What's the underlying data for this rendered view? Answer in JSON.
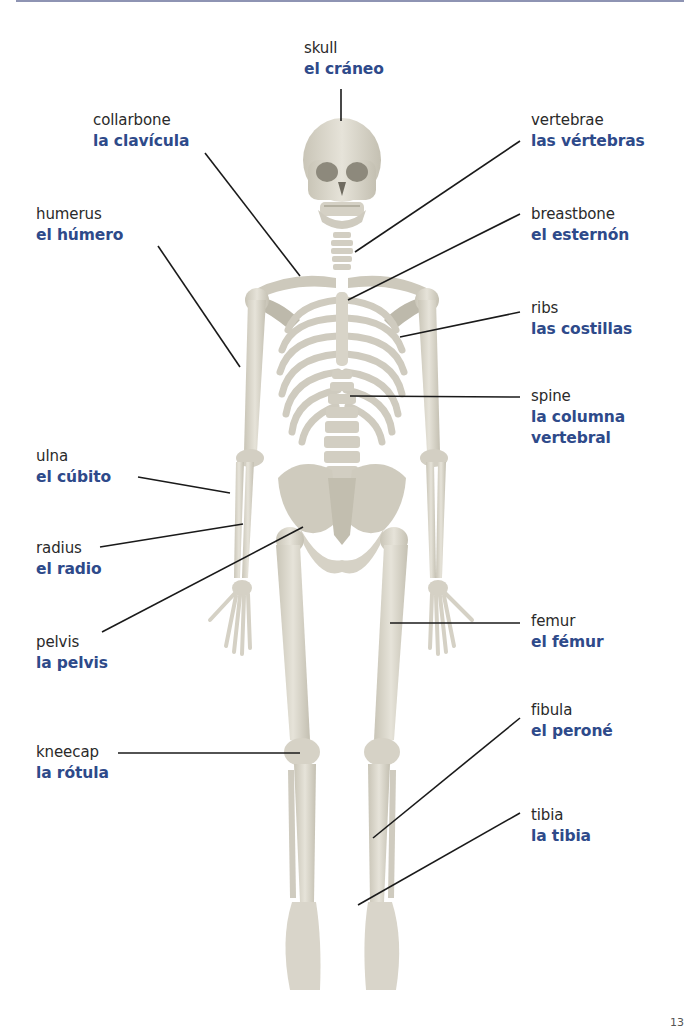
{
  "diagram": {
    "colors": {
      "english_text": "#2a2a2a",
      "spanish_text": "#2e4a8a",
      "bone": "#dedbd0",
      "bone_shade": "#b9b5a6",
      "leader_line": "#1a1a1a",
      "top_rule": "#8e94b3"
    },
    "labels": [
      {
        "id": "skull",
        "en": "skull",
        "es": "el cráneo"
      },
      {
        "id": "collarbone",
        "en": "collarbone",
        "es": "la clavícula"
      },
      {
        "id": "vertebrae",
        "en": "vertebrae",
        "es": "las vértebras"
      },
      {
        "id": "humerus",
        "en": "humerus",
        "es": "el húmero"
      },
      {
        "id": "breastbone",
        "en": "breastbone",
        "es": "el esternón"
      },
      {
        "id": "ribs",
        "en": "ribs",
        "es": "las costillas"
      },
      {
        "id": "spine",
        "en": "spine",
        "es_line1": "la columna",
        "es_line2": "vertebral"
      },
      {
        "id": "ulna",
        "en": "ulna",
        "es": "el cúbito"
      },
      {
        "id": "radius",
        "en": "radius",
        "es": "el radio"
      },
      {
        "id": "pelvis",
        "en": "pelvis",
        "es": "la pelvis"
      },
      {
        "id": "femur",
        "en": "femur",
        "es": "el fémur"
      },
      {
        "id": "fibula",
        "en": "fibula",
        "es": "el peroné"
      },
      {
        "id": "kneecap",
        "en": "kneecap",
        "es": "la rótula"
      },
      {
        "id": "tibia",
        "en": "tibia",
        "es": "la tibia"
      }
    ],
    "page_number": "13"
  }
}
